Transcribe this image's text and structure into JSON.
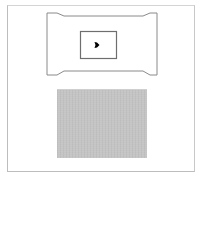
{
  "canvas": {
    "width": 202,
    "height": 178,
    "background": "#ffffff"
  },
  "outer_frame": {
    "x": 7,
    "y": 5,
    "width": 188,
    "height": 167,
    "border_color": "#c8c8c8"
  },
  "tab_shape": {
    "stroke": "#8a8a8a",
    "fill": "#ffffff",
    "points": "47,13 57,13 64,16 143,16 150,13 157,13 157,75 150,75 143,71 64,71 57,75 47,75"
  },
  "inner_box": {
    "x": 80,
    "y": 31,
    "width": 36,
    "height": 27,
    "stroke": "#6e6e6e",
    "fill": "#ffffff"
  },
  "marker": {
    "icon": "diamond-arrow-icon",
    "cx": 97,
    "cy": 45,
    "color": "#000000"
  },
  "gray_panel": {
    "x": 57,
    "y": 89,
    "width": 90,
    "height": 68,
    "color": "#c4c4c4"
  }
}
